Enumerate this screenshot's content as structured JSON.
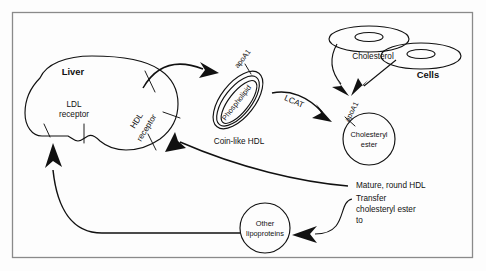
{
  "figure": {
    "domain_title": "HDL metabolism and reverse cholesterol transport pathway",
    "background_color": "#fdfdfd",
    "ink_color": "#111111",
    "frame_color": "#8a8a8a"
  },
  "nodes": {
    "liver": {
      "label": "Liver",
      "ldl_receptor_line1": "LDL",
      "ldl_receptor_line2": "receptor",
      "hdl_receptor_line1": "HDL",
      "hdl_receptor_line2": "receptor"
    },
    "coin_hdl": {
      "apo_label": "apoA1",
      "inner_label": "Phospholipid",
      "caption": "Coin-like HDL"
    },
    "cells": {
      "label": "Cells",
      "cholesterol_label": "Cholesterol"
    },
    "mature_hdl": {
      "apo_label": "apoA1",
      "inner_line1": "Cholesteryl",
      "inner_line2": "ester",
      "caption": "Mature, round HDL"
    },
    "other_lipoproteins": {
      "line1": "Other",
      "line2": "lipoproteins"
    }
  },
  "edges": {
    "lcat": "LCAT",
    "transfer_line1": "Transfer",
    "transfer_line2": "cholesteryl ester",
    "transfer_line3": "to"
  }
}
